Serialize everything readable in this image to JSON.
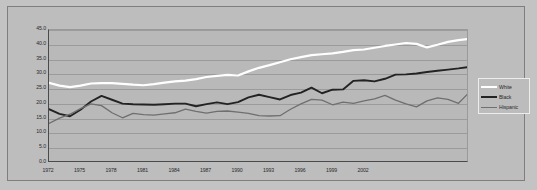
{
  "chart_data": {
    "type": "line",
    "title": "",
    "subtitle": "",
    "xlabel": "",
    "ylabel": "",
    "xlim": [
      1972,
      2003
    ],
    "ylim": [
      0.0,
      45.0
    ],
    "grid": true,
    "legend_position": "right-outside",
    "y_ticks": [
      "45.0",
      "40.0",
      "35.0",
      "30.0",
      "25.0",
      "20.0",
      "15.0",
      "10.0",
      "5.0",
      "0.0"
    ],
    "y_tick_values": [
      45.0,
      40.0,
      35.0,
      30.0,
      25.0,
      20.0,
      15.0,
      10.0,
      5.0,
      0.0
    ],
    "x_ticks": [
      "1972",
      "1975",
      "1978",
      "1981",
      "1984",
      "1987",
      "1990",
      "1993",
      "1996",
      "1999",
      "2002"
    ],
    "x_tick_values": [
      1972,
      1975,
      1978,
      1981,
      1984,
      1987,
      1990,
      1993,
      1996,
      1999,
      2002
    ],
    "x": [
      1972,
      1973,
      1974,
      1975,
      1976,
      1977,
      1978,
      1979,
      1980,
      1981,
      1982,
      1983,
      1984,
      1985,
      1986,
      1987,
      1988,
      1989,
      1990,
      1991,
      1992,
      1993,
      1994,
      1995,
      1996,
      1997,
      1998,
      1999,
      2000,
      2001,
      2002,
      2003
    ],
    "series": [
      {
        "name": "White",
        "color": "#ffffff",
        "width": 2.2,
        "values": [
          27.1,
          26.2,
          25.7,
          26.2,
          26.9,
          27.0,
          27.0,
          26.8,
          26.5,
          26.3,
          26.7,
          27.2,
          27.6,
          27.9,
          28.4,
          29.1,
          29.5,
          29.8,
          29.6,
          31.0,
          32.2,
          33.1,
          34.1,
          35.1,
          35.8,
          36.5,
          36.8,
          37.1,
          37.6,
          38.2,
          38.4,
          39.0
        ]
      },
      {
        "name": "Black",
        "color": "#232323",
        "width": 1.9,
        "values": [
          18.2,
          16.6,
          15.8,
          18.0,
          20.8,
          22.7,
          21.4,
          20.1,
          19.9,
          19.8,
          19.7,
          19.9,
          20.1,
          20.1,
          19.2,
          19.9,
          20.5,
          19.9,
          20.6,
          22.2,
          23.1,
          22.3,
          21.5,
          23.0,
          23.8,
          25.5,
          23.6,
          24.8,
          24.9,
          27.8,
          28.0,
          27.6
        ]
      },
      {
        "name": "Hispanic",
        "color": "#6f6f6f",
        "width": 1.3,
        "values": [
          13.4,
          15.2,
          16.5,
          18.4,
          20.0,
          19.4,
          17.0,
          15.3,
          16.8,
          16.4,
          16.2,
          16.6,
          17.0,
          18.2,
          17.5,
          16.9,
          17.5,
          17.6,
          17.2,
          16.8,
          16.0,
          15.9,
          16.0,
          18.2,
          20.0,
          21.5,
          21.3,
          19.7,
          20.6,
          20.2,
          21.0,
          21.7
        ]
      }
    ],
    "series_tail": {
      "White": [
        39.6,
        40.1,
        40.6,
        40.3,
        39.1,
        40.0,
        41.0,
        41.6,
        42.0
      ],
      "Black": [
        28.5,
        29.9,
        30.0,
        30.3,
        30.8,
        31.2,
        31.6,
        32.0,
        32.5
      ],
      "Hispanic": [
        22.9,
        21.3,
        20.0,
        19.0,
        21.0,
        22.0,
        21.5,
        20.2,
        23.8
      ]
    }
  },
  "legend": {
    "entries": [
      {
        "label": "White"
      },
      {
        "label": "Black"
      },
      {
        "label": "Hispanic"
      }
    ]
  }
}
